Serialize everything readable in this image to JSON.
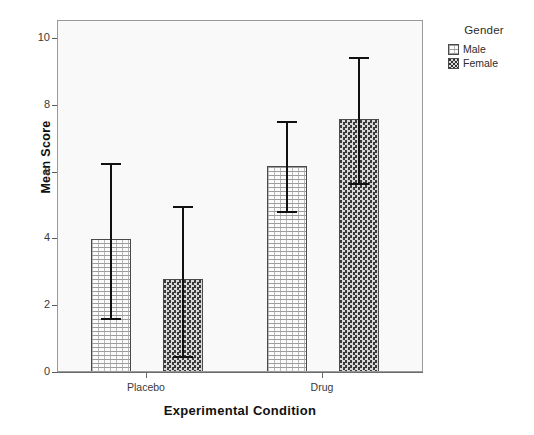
{
  "chart_data": {
    "type": "bar",
    "title": "",
    "xlabel": "Experimental Condition",
    "ylabel": "Mean Score",
    "categories": [
      "Placebo",
      "Drug"
    ],
    "series": [
      {
        "name": "Male",
        "values": [
          4.0,
          6.2
        ],
        "error_low": [
          1.65,
          4.85
        ],
        "error_high": [
          6.3,
          7.55
        ]
      },
      {
        "name": "Female",
        "values": [
          2.8,
          7.6
        ],
        "error_low": [
          0.5,
          5.7
        ],
        "error_high": [
          5.0,
          9.45
        ]
      }
    ],
    "ylim": [
      0,
      10.55
    ],
    "yticks": [
      0,
      2,
      4,
      6,
      8,
      10
    ],
    "ytick_labels": [
      "0",
      "2",
      "4",
      "6",
      "8",
      "10"
    ],
    "grid": false,
    "legend_position": "right",
    "legend_title": "Gender",
    "error_bar_type": "95% CI"
  },
  "axes": {
    "y_title": "Mean Score",
    "x_title": "Experimental Condition",
    "y_tick_labels": [
      "10",
      "8",
      "6",
      "4",
      "2",
      "0"
    ],
    "x_tick_labels": [
      "Placebo",
      "Drug"
    ]
  },
  "legend": {
    "title": "Gender",
    "items": [
      {
        "label": "Male",
        "pattern": "light-dotted"
      },
      {
        "label": "Female",
        "pattern": "dark-checkered"
      }
    ]
  },
  "colors": {
    "plot_background": "#f9f9f9",
    "frame_border": "#9a9a9a",
    "axis_line": "#6b6b6b",
    "bar_outline": "#4a4a4a",
    "male_fill": "#fbfbfb",
    "female_fill": "#4e4e4e",
    "error_bar": "#111111",
    "text": "#2c2c2c"
  }
}
